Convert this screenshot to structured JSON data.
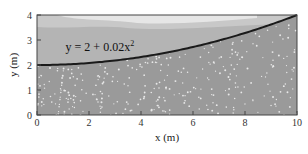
{
  "chart_data": {
    "type": "line",
    "title": "",
    "xlabel": "x (m)",
    "ylabel": "y (m)",
    "xlim": [
      0,
      10
    ],
    "ylim": [
      0,
      4
    ],
    "x_ticks": [
      0,
      2,
      4,
      6,
      8,
      10
    ],
    "y_ticks": [
      0,
      1,
      2,
      3,
      4
    ],
    "x_tick_labels": [
      "0",
      "2",
      "4",
      "6",
      "8",
      "10"
    ],
    "y_tick_labels": [
      "0",
      "1",
      "2",
      "3",
      "4"
    ],
    "grid": false,
    "series": [
      {
        "name": "y = 2 + 0.02x²",
        "equation": {
          "a": 2,
          "b": 0.02
        },
        "x": [
          0,
          1,
          2,
          3,
          4,
          5,
          6,
          7,
          8,
          9,
          10
        ],
        "y": [
          2,
          2.02,
          2.08,
          2.18,
          2.32,
          2.5,
          2.72,
          2.98,
          3.28,
          3.62,
          4
        ]
      }
    ],
    "annotations": [
      {
        "text": "y = 2 + 0.02x",
        "superscript": "2",
        "x": 1.1,
        "y": 2.55
      }
    ],
    "colors": {
      "ground": "#9a9a9a",
      "speckle": "#e8e8e8",
      "sky_low": "#b4b4b4",
      "sky_mid": "#c8c8c8",
      "cloud": "#e6e6e6",
      "curve": "#1a1a1a",
      "frame": "#444444"
    }
  }
}
